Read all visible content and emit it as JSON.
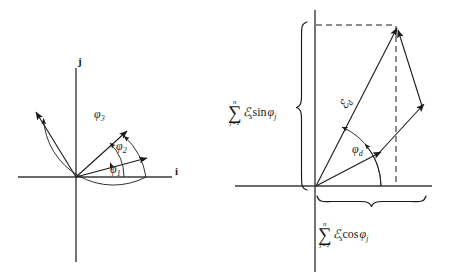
{
  "figure": {
    "background_color": "#ffffff",
    "stroke_color": "#1a1a1a"
  },
  "left_panel": {
    "name": "individual-phasors-diagram",
    "axis_labels": {
      "horizontal": "i",
      "vertical": "j"
    },
    "angle_labels": [
      {
        "id": "phi1",
        "base": "φ",
        "sub": "1"
      },
      {
        "id": "phi2",
        "base": "φ",
        "sub": "2"
      },
      {
        "id": "phi3",
        "base": "φ",
        "sub": "3"
      }
    ],
    "vectors": [
      {
        "id": "vector-1",
        "angle_deg": 15
      },
      {
        "id": "vector-2",
        "angle_deg": 48
      },
      {
        "id": "vector-3",
        "angle_deg": 118
      }
    ]
  },
  "right_panel": {
    "name": "vector-sum-diagram",
    "resultant_label": {
      "base": "ℰ",
      "sub": "d"
    },
    "angle_label": {
      "base": "φ",
      "sub": "d"
    },
    "vertical_sum": {
      "sigma": "∑",
      "upper_limit": "n",
      "lower_limit": "j=1",
      "term_symbol": "ℰ",
      "term_subscript": "s",
      "function": "sin",
      "function_arg_base": "φ",
      "function_arg_sub": "j"
    },
    "horizontal_sum": {
      "sigma": "∑",
      "upper_limit": "n",
      "lower_limit": "j=1",
      "term_symbol": "ℰ",
      "term_subscript": "s",
      "function": "cos",
      "function_arg_base": "φ",
      "function_arg_sub": "j"
    }
  }
}
